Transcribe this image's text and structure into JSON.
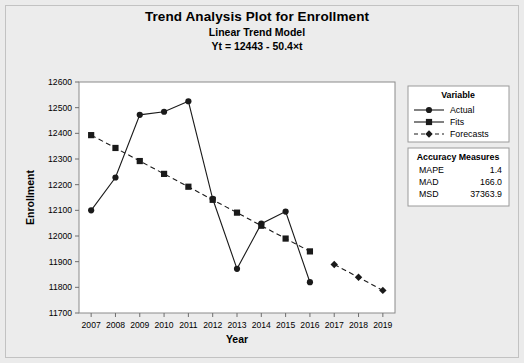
{
  "titles": {
    "main": "Trend Analysis Plot for Enrollment",
    "sub": "Linear Trend Model",
    "equation": "Yt = 12443 - 50.4×t"
  },
  "legend": {
    "title": "Variable",
    "items": [
      {
        "label": "Actual",
        "marker": "circle",
        "dash": "solid"
      },
      {
        "label": "Fits",
        "marker": "square",
        "dash": "solid"
      },
      {
        "label": "Forecasts",
        "marker": "diamond",
        "dash": "dashed"
      }
    ]
  },
  "accuracy": {
    "title": "Accuracy Measures",
    "rows": [
      {
        "name": "MAPE",
        "value": "1.4"
      },
      {
        "name": "MAD",
        "value": "166.0"
      },
      {
        "name": "MSD",
        "value": "37363.9"
      }
    ]
  },
  "colors": {
    "page_background": "#ebebeb",
    "plot_background": "#ffffff",
    "series": "#1a1a1a",
    "axis": "#808080",
    "frame": "#c2c2c2"
  },
  "chart_data": {
    "type": "line",
    "title": "Trend Analysis Plot for Enrollment",
    "subtitle": "Linear Trend Model",
    "annotation": "Yt = 12443 - 50.4×t",
    "xlabel": "Year",
    "ylabel": "Enrollment",
    "x": [
      2007,
      2008,
      2009,
      2010,
      2011,
      2012,
      2013,
      2014,
      2015,
      2016,
      2017,
      2018,
      2019
    ],
    "xlim": [
      2006.5,
      2019.5
    ],
    "ylim": [
      11700,
      12600
    ],
    "yticks": [
      11700,
      11800,
      11900,
      12000,
      12100,
      12200,
      12300,
      12400,
      12500,
      12600
    ],
    "xticks": [
      2007,
      2008,
      2009,
      2010,
      2011,
      2012,
      2013,
      2014,
      2015,
      2016,
      2017,
      2018,
      2019
    ],
    "grid": false,
    "legend_position": "right",
    "series": [
      {
        "name": "Actual",
        "marker": "circle",
        "dash": "solid",
        "x": [
          2007,
          2008,
          2009,
          2010,
          2011,
          2012,
          2013,
          2014,
          2015,
          2016
        ],
        "values": [
          12100,
          12228,
          12472,
          12484,
          12525,
          12145,
          11872,
          12048,
          12095,
          11820
        ]
      },
      {
        "name": "Fits",
        "marker": "square",
        "dash": "dashed",
        "x": [
          2007,
          2008,
          2009,
          2010,
          2011,
          2012,
          2013,
          2014,
          2015,
          2016
        ],
        "values": [
          12393,
          12343,
          12292,
          12242,
          12192,
          12141,
          12091,
          12040,
          11990,
          11940
        ]
      },
      {
        "name": "Forecasts",
        "marker": "diamond",
        "dash": "dashed",
        "x": [
          2017,
          2018,
          2019
        ],
        "values": [
          11889,
          11839,
          11788
        ]
      }
    ]
  }
}
